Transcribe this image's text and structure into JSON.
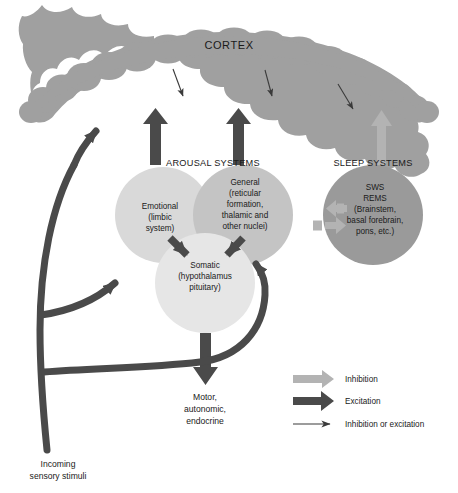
{
  "figure": {
    "background_color": "#ffffff"
  },
  "colors": {
    "cortex_gray": "#a0a0a0",
    "circle_light": "#d9d9d9",
    "circle_mid": "#c4c4c4",
    "circle_pale": "#e6e6e6",
    "circle_dark": "#9a9a9a",
    "arrow_dark": "#4a4a4a",
    "arrow_light": "#b3b3b3",
    "text": "#1a1a1a"
  },
  "cortex": {
    "label": "CORTEX"
  },
  "groups": {
    "arousal": {
      "label": "AROUSAL SYSTEMS"
    },
    "sleep": {
      "label": "SLEEP SYSTEMS"
    }
  },
  "nodes": {
    "emotional": {
      "name": "emotional-circle",
      "lines": [
        "Emotional",
        "(limbic",
        "system)"
      ]
    },
    "general": {
      "name": "general-circle",
      "lines": [
        "General",
        "(reticular",
        "formation,",
        "thalamic and",
        "other nuclei)"
      ]
    },
    "somatic": {
      "name": "somatic-circle",
      "lines": [
        "Somatic",
        "(hypothalamus",
        "pituitary)"
      ]
    },
    "sleep_node": {
      "name": "sleep-circle",
      "lines": [
        "SWS",
        "REMS",
        "(Brainstem,",
        "basal forebrain,",
        "pons, etc.)"
      ]
    }
  },
  "outputs": {
    "motor": {
      "lines": [
        "Motor,",
        "autonomic,",
        "endocrine"
      ]
    },
    "incoming": {
      "lines": [
        "Incoming",
        "sensory stimuli"
      ]
    }
  },
  "legend": {
    "items": [
      {
        "key": "inhibition",
        "label": "Inhibition",
        "style": "thick-light-arrow",
        "color": "#b3b3b3"
      },
      {
        "key": "excitation",
        "label": "Excitation",
        "style": "thick-dark-arrow",
        "color": "#4a4a4a"
      },
      {
        "key": "inhibition-or-excitation",
        "label": "Inhibition or excitation",
        "style": "thin-dark-arrow",
        "color": "#3a3a3a"
      }
    ]
  }
}
